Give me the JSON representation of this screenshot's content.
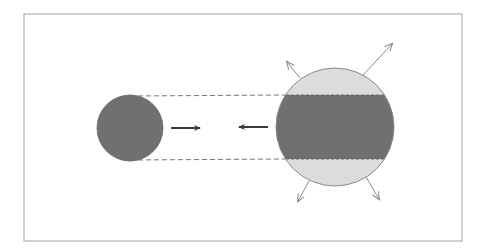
{
  "figure": {
    "colors": {
      "background": "#ffffff",
      "frame": "#9a9a9a",
      "dense": "#707070",
      "light_cap": "#dcdcdc",
      "outline": "#8a8a8a",
      "arrow_dark": "#3a3a3a",
      "arrow_light": "#8a8a8a",
      "dashed": "#777777"
    },
    "small_sphere": {
      "cx": 130,
      "cy": 128,
      "r": 33
    },
    "large_sphere": {
      "cx": 335,
      "cy": 127,
      "r": 59
    },
    "band": {
      "y_top": 95,
      "y_bottom": 159
    },
    "arrows": [
      {
        "name": "arrow-right",
        "from": [
          171,
          128
        ],
        "to": [
          201,
          128
        ]
      },
      {
        "name": "arrow-left",
        "from": [
          268,
          127
        ],
        "to": [
          238,
          127
        ]
      }
    ],
    "fragment_arrows": [
      {
        "name": "fragment-arrow-upper-left",
        "from": [
          300,
          78
        ],
        "to": [
          287,
          62
        ]
      },
      {
        "name": "fragment-arrow-upper-right",
        "from": [
          363,
          75
        ],
        "to": [
          392,
          44
        ]
      },
      {
        "name": "fragment-arrow-lower-left",
        "from": [
          309,
          181
        ],
        "to": [
          298,
          201
        ]
      },
      {
        "name": "fragment-arrow-lower-right",
        "from": [
          366,
          177
        ],
        "to": [
          379,
          199
        ]
      }
    ]
  }
}
